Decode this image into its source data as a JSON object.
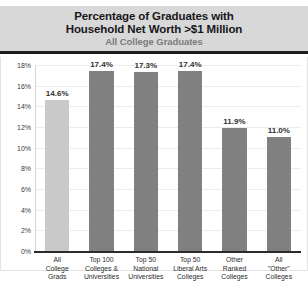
{
  "header": {
    "title": "Percentage of Graduates with\nHousehold Net Worth >$1 Million",
    "subtitle": "All College Graduates",
    "band_color": "#d8d8d8",
    "rule_color": "#1d1d1d"
  },
  "chart_data": {
    "type": "bar",
    "title": "Percentage of Graduates with Household Net Worth >$1 Million",
    "subtitle": "All College Graduates",
    "xlabel": "",
    "ylabel": "",
    "ylim": [
      0,
      18
    ],
    "ytick_step": 2,
    "ytick_labels": [
      "0%",
      "2%",
      "4%",
      "6%",
      "8%",
      "10%",
      "12%",
      "14%",
      "16%",
      "18%"
    ],
    "ytick_values": [
      0,
      2,
      4,
      6,
      8,
      10,
      12,
      14,
      16,
      18
    ],
    "grid": true,
    "legend": "none",
    "value_suffix": "%",
    "categories": [
      "All\nCollege\nGrads",
      "Top 100\nColleges &\nUniversities",
      "Top 50\nNational\nUniversities",
      "Top 50\nLiberal Arts\nColleges",
      "Other\nRanked\nColleges",
      "All\n\"Other\"\nColleges"
    ],
    "values": [
      14.6,
      17.4,
      17.3,
      17.4,
      11.9,
      11.0
    ],
    "value_labels": [
      "14.6%",
      "17.4%",
      "17.3%",
      "17.4%",
      "11.9%",
      "11.0%"
    ],
    "bar_colors": [
      "#c9c9c9",
      "#808080",
      "#808080",
      "#808080",
      "#808080",
      "#808080"
    ],
    "highlight_index": 0,
    "gridline_color": "#ececec",
    "axis_color": "#2b2b2b"
  }
}
